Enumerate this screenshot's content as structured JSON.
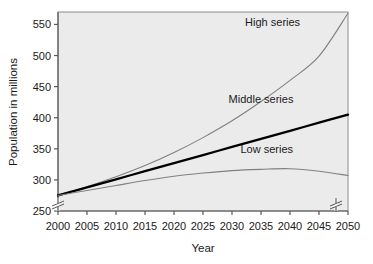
{
  "chart_data": {
    "type": "line",
    "title": "",
    "xlabel": "Year",
    "ylabel": "Population in millions",
    "x": [
      2000,
      2005,
      2010,
      2015,
      2020,
      2025,
      2030,
      2035,
      2040,
      2045,
      2050
    ],
    "xticklabels": [
      "2000",
      "2005",
      "2010",
      "2015",
      "2020",
      "2025",
      "2030",
      "2035",
      "2040",
      "2045",
      "2050"
    ],
    "yticklabels": [
      "250",
      "300",
      "350",
      "400",
      "450",
      "500",
      "550"
    ],
    "yticks": [
      250,
      300,
      350,
      400,
      450,
      500,
      550
    ],
    "xlim": [
      2000,
      2050
    ],
    "ylim": [
      250,
      570
    ],
    "axis_break_y": true,
    "axis_break_x_right": true,
    "grid": false,
    "legend_position": "inline-annotations",
    "plot_background": "#ebebeb",
    "series": [
      {
        "name": "High series",
        "color": "#808080",
        "width": 1.1,
        "label_x": 2037,
        "label_y": 548,
        "values": [
          275,
          289,
          305,
          323,
          344,
          368,
          395,
          426,
          460,
          499,
          568
        ]
      },
      {
        "name": "Middle series",
        "color": "#000000",
        "width": 2.3,
        "label_x": 2035,
        "label_y": 424,
        "values": [
          275,
          288,
          301,
          314,
          327,
          340,
          353,
          366,
          379,
          392,
          405
        ]
      },
      {
        "name": "Low series",
        "color": "#808080",
        "width": 1.1,
        "label_x": 2036,
        "label_y": 343,
        "values": [
          275,
          283,
          291,
          299,
          306,
          311,
          315,
          317,
          318,
          314,
          307
        ]
      }
    ]
  },
  "geometry": {
    "plot_left": 58,
    "plot_right": 348,
    "plot_top": 12,
    "plot_bottom": 211
  }
}
